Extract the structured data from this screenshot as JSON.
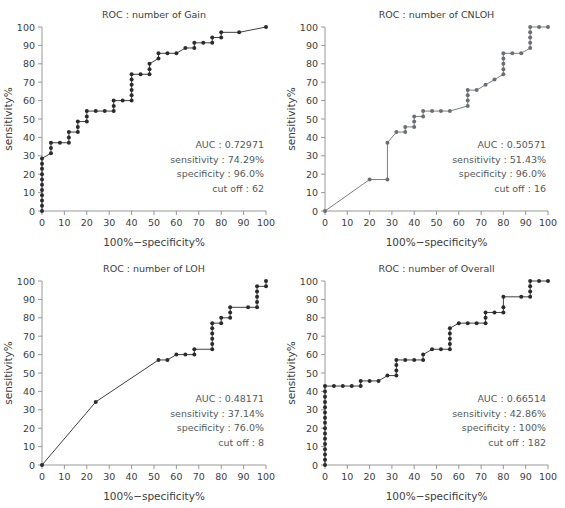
{
  "figure": {
    "panel_count": 4,
    "axis_label_x": "100%−specificity%",
    "axis_label_y": "sensitivity%",
    "tick_labels_x": [
      "0",
      "10",
      "20",
      "30",
      "40",
      "50",
      "60",
      "70",
      "80",
      "90",
      "100"
    ],
    "tick_labels_y": [
      "0",
      "10",
      "20",
      "30",
      "40",
      "50",
      "60",
      "70",
      "80",
      "90",
      "100"
    ],
    "stat_keys": {
      "auc": "AUC",
      "sensitivity": "sensitivity",
      "specificity": "specificity",
      "cutoff": "cut off"
    }
  },
  "chart_data": [
    {
      "type": "line",
      "id": "roc-gain",
      "title": "ROC : number of Gain",
      "xlabel": "100%−specificity%",
      "ylabel": "sensitivity%",
      "xlim": [
        0,
        100
      ],
      "ylim": [
        0,
        100
      ],
      "xticks": [
        0,
        10,
        20,
        30,
        40,
        50,
        60,
        70,
        80,
        90,
        100
      ],
      "yticks": [
        0,
        10,
        20,
        30,
        40,
        50,
        60,
        70,
        80,
        90,
        100
      ],
      "grid": false,
      "legend": "none",
      "color": "#2b2b2b",
      "marker": "circle",
      "annotations": {
        "auc_label": "AUC : 0.72971",
        "sensitivity_label": "sensitivity : 74.29%",
        "specificity_label": "specificity : 96.0%",
        "cutoff_label": "cut off : 62",
        "auc": 0.72971,
        "sensitivity": 74.29,
        "specificity": 96.0,
        "cutoff": 62
      },
      "points": [
        [
          0,
          0
        ],
        [
          0,
          2.9
        ],
        [
          0,
          5.7
        ],
        [
          0,
          8.6
        ],
        [
          0,
          11.4
        ],
        [
          0,
          14.3
        ],
        [
          0,
          17.1
        ],
        [
          0,
          20
        ],
        [
          0,
          22.9
        ],
        [
          0,
          25.7
        ],
        [
          0,
          28.6
        ],
        [
          4,
          31.4
        ],
        [
          4,
          34.3
        ],
        [
          4,
          37.1
        ],
        [
          8,
          37.1
        ],
        [
          12,
          37.1
        ],
        [
          12,
          40
        ],
        [
          12,
          42.9
        ],
        [
          16,
          42.9
        ],
        [
          16,
          45.7
        ],
        [
          16,
          48.6
        ],
        [
          20,
          48.6
        ],
        [
          20,
          51.4
        ],
        [
          20,
          54.3
        ],
        [
          24,
          54.3
        ],
        [
          28,
          54.3
        ],
        [
          32,
          54.3
        ],
        [
          32,
          57.1
        ],
        [
          32,
          60
        ],
        [
          36,
          60
        ],
        [
          40,
          60
        ],
        [
          40,
          62.9
        ],
        [
          40,
          65.7
        ],
        [
          40,
          68.6
        ],
        [
          40,
          71.4
        ],
        [
          40,
          74.3
        ],
        [
          44,
          74.3
        ],
        [
          48,
          74.3
        ],
        [
          48,
          77.1
        ],
        [
          48,
          80
        ],
        [
          52,
          82.9
        ],
        [
          52,
          85.7
        ],
        [
          56,
          85.7
        ],
        [
          60,
          85.7
        ],
        [
          64,
          88.6
        ],
        [
          68,
          88.6
        ],
        [
          68,
          91.4
        ],
        [
          72,
          91.4
        ],
        [
          76,
          91.4
        ],
        [
          76,
          94.3
        ],
        [
          80,
          94.3
        ],
        [
          80,
          97.1
        ],
        [
          88,
          97.1
        ],
        [
          100,
          100
        ]
      ]
    },
    {
      "type": "line",
      "id": "roc-cnloh",
      "title": "ROC : number of CNLOH",
      "xlabel": "100%−specificity%",
      "ylabel": "sensitivity%",
      "xlim": [
        0,
        100
      ],
      "ylim": [
        0,
        100
      ],
      "xticks": [
        0,
        10,
        20,
        30,
        40,
        50,
        60,
        70,
        80,
        90,
        100
      ],
      "yticks": [
        0,
        10,
        20,
        30,
        40,
        50,
        60,
        70,
        80,
        90,
        100
      ],
      "grid": false,
      "legend": "none",
      "color": "#6b6f73",
      "marker": "circle",
      "annotations": {
        "auc_label": "AUC : 0.50571",
        "sensitivity_label": "sensitivity : 51.43%",
        "specificity_label": "specificity : 96.0%",
        "cutoff_label": "cut off : 16",
        "auc": 0.50571,
        "sensitivity": 51.43,
        "specificity": 96.0,
        "cutoff": 16
      },
      "points": [
        [
          0,
          0
        ],
        [
          20,
          17.1
        ],
        [
          28,
          17.1
        ],
        [
          28,
          37.1
        ],
        [
          32,
          42.9
        ],
        [
          36,
          42.9
        ],
        [
          36,
          45.7
        ],
        [
          40,
          45.7
        ],
        [
          40,
          48.6
        ],
        [
          40,
          51.4
        ],
        [
          44,
          51.4
        ],
        [
          44,
          54.3
        ],
        [
          48,
          54.3
        ],
        [
          52,
          54.3
        ],
        [
          56,
          54.3
        ],
        [
          64,
          57.1
        ],
        [
          64,
          60
        ],
        [
          64,
          62.9
        ],
        [
          64,
          65.7
        ],
        [
          68,
          65.7
        ],
        [
          72,
          68.6
        ],
        [
          76,
          71.4
        ],
        [
          80,
          74.3
        ],
        [
          80,
          77.1
        ],
        [
          80,
          80
        ],
        [
          80,
          82.9
        ],
        [
          80,
          85.7
        ],
        [
          84,
          85.7
        ],
        [
          88,
          85.7
        ],
        [
          92,
          88.6
        ],
        [
          92,
          91.4
        ],
        [
          92,
          94.3
        ],
        [
          92,
          97.1
        ],
        [
          92,
          100
        ],
        [
          96,
          100
        ],
        [
          100,
          100
        ]
      ]
    },
    {
      "type": "line",
      "id": "roc-loh",
      "title": "ROC : number of LOH",
      "xlabel": "100%−specificity%",
      "ylabel": "sensitivity%",
      "xlim": [
        0,
        100
      ],
      "ylim": [
        0,
        100
      ],
      "xticks": [
        0,
        10,
        20,
        30,
        40,
        50,
        60,
        70,
        80,
        90,
        100
      ],
      "yticks": [
        0,
        10,
        20,
        30,
        40,
        50,
        60,
        70,
        80,
        90,
        100
      ],
      "grid": false,
      "legend": "none",
      "color": "#2b2b2b",
      "marker": "circle",
      "annotations": {
        "auc_label": "AUC : 0.48171",
        "sensitivity_label": "sensitivity : 37.14%",
        "specificity_label": "specificity : 76.0%",
        "cutoff_label": "cut off : 8",
        "auc": 0.48171,
        "sensitivity": 37.14,
        "specificity": 76.0,
        "cutoff": 8
      },
      "points": [
        [
          0,
          0
        ],
        [
          24,
          34.3
        ],
        [
          52,
          57.1
        ],
        [
          56,
          57.1
        ],
        [
          60,
          60
        ],
        [
          64,
          60
        ],
        [
          68,
          60
        ],
        [
          68,
          62.9
        ],
        [
          76,
          62.9
        ],
        [
          76,
          65.7
        ],
        [
          76,
          68.6
        ],
        [
          76,
          71.4
        ],
        [
          76,
          74.3
        ],
        [
          76,
          77.1
        ],
        [
          80,
          77.1
        ],
        [
          80,
          80
        ],
        [
          84,
          80
        ],
        [
          84,
          82.9
        ],
        [
          84,
          85.7
        ],
        [
          92,
          85.7
        ],
        [
          96,
          85.7
        ],
        [
          96,
          88.6
        ],
        [
          96,
          91.4
        ],
        [
          96,
          94.3
        ],
        [
          96,
          97.1
        ],
        [
          100,
          97.1
        ],
        [
          100,
          100
        ]
      ]
    },
    {
      "type": "line",
      "id": "roc-overall",
      "title": "ROC : number of Overall",
      "xlabel": "100%−specificity%",
      "ylabel": "sensitivity%",
      "xlim": [
        0,
        100
      ],
      "ylim": [
        0,
        100
      ],
      "xticks": [
        0,
        10,
        20,
        30,
        40,
        50,
        60,
        70,
        80,
        90,
        100
      ],
      "yticks": [
        0,
        10,
        20,
        30,
        40,
        50,
        60,
        70,
        80,
        90,
        100
      ],
      "grid": false,
      "legend": "none",
      "color": "#2b2b2b",
      "marker": "circle",
      "annotations": {
        "auc_label": "AUC : 0.66514",
        "sensitivity_label": "sensitivity : 42.86%",
        "specificity_label": "specificity : 100%",
        "cutoff_label": "cut off : 182",
        "auc": 0.66514,
        "sensitivity": 42.86,
        "specificity": 100,
        "cutoff": 182
      },
      "points": [
        [
          0,
          0
        ],
        [
          0,
          2.9
        ],
        [
          0,
          5.7
        ],
        [
          0,
          8.6
        ],
        [
          0,
          11.4
        ],
        [
          0,
          14.3
        ],
        [
          0,
          17.1
        ],
        [
          0,
          20
        ],
        [
          0,
          22.9
        ],
        [
          0,
          25.7
        ],
        [
          0,
          28.6
        ],
        [
          0,
          31.4
        ],
        [
          0,
          34.3
        ],
        [
          0,
          37.1
        ],
        [
          0,
          40
        ],
        [
          0,
          42.9
        ],
        [
          4,
          42.9
        ],
        [
          8,
          42.9
        ],
        [
          12,
          42.9
        ],
        [
          16,
          42.9
        ],
        [
          16,
          45.7
        ],
        [
          20,
          45.7
        ],
        [
          24,
          45.7
        ],
        [
          28,
          48.6
        ],
        [
          32,
          48.6
        ],
        [
          32,
          51.4
        ],
        [
          32,
          54.3
        ],
        [
          32,
          57.1
        ],
        [
          36,
          57.1
        ],
        [
          40,
          57.1
        ],
        [
          44,
          57.1
        ],
        [
          44,
          60
        ],
        [
          48,
          62.9
        ],
        [
          52,
          62.9
        ],
        [
          56,
          62.9
        ],
        [
          56,
          65.7
        ],
        [
          56,
          68.6
        ],
        [
          56,
          71.4
        ],
        [
          56,
          74.3
        ],
        [
          60,
          77.1
        ],
        [
          64,
          77.1
        ],
        [
          68,
          77.1
        ],
        [
          72,
          77.1
        ],
        [
          72,
          80
        ],
        [
          72,
          82.9
        ],
        [
          76,
          82.9
        ],
        [
          80,
          82.9
        ],
        [
          80,
          85.7
        ],
        [
          80,
          91.4
        ],
        [
          88,
          91.4
        ],
        [
          92,
          91.4
        ],
        [
          92,
          94.3
        ],
        [
          92,
          97.1
        ],
        [
          92,
          100
        ],
        [
          96,
          100
        ],
        [
          100,
          100
        ]
      ]
    }
  ]
}
